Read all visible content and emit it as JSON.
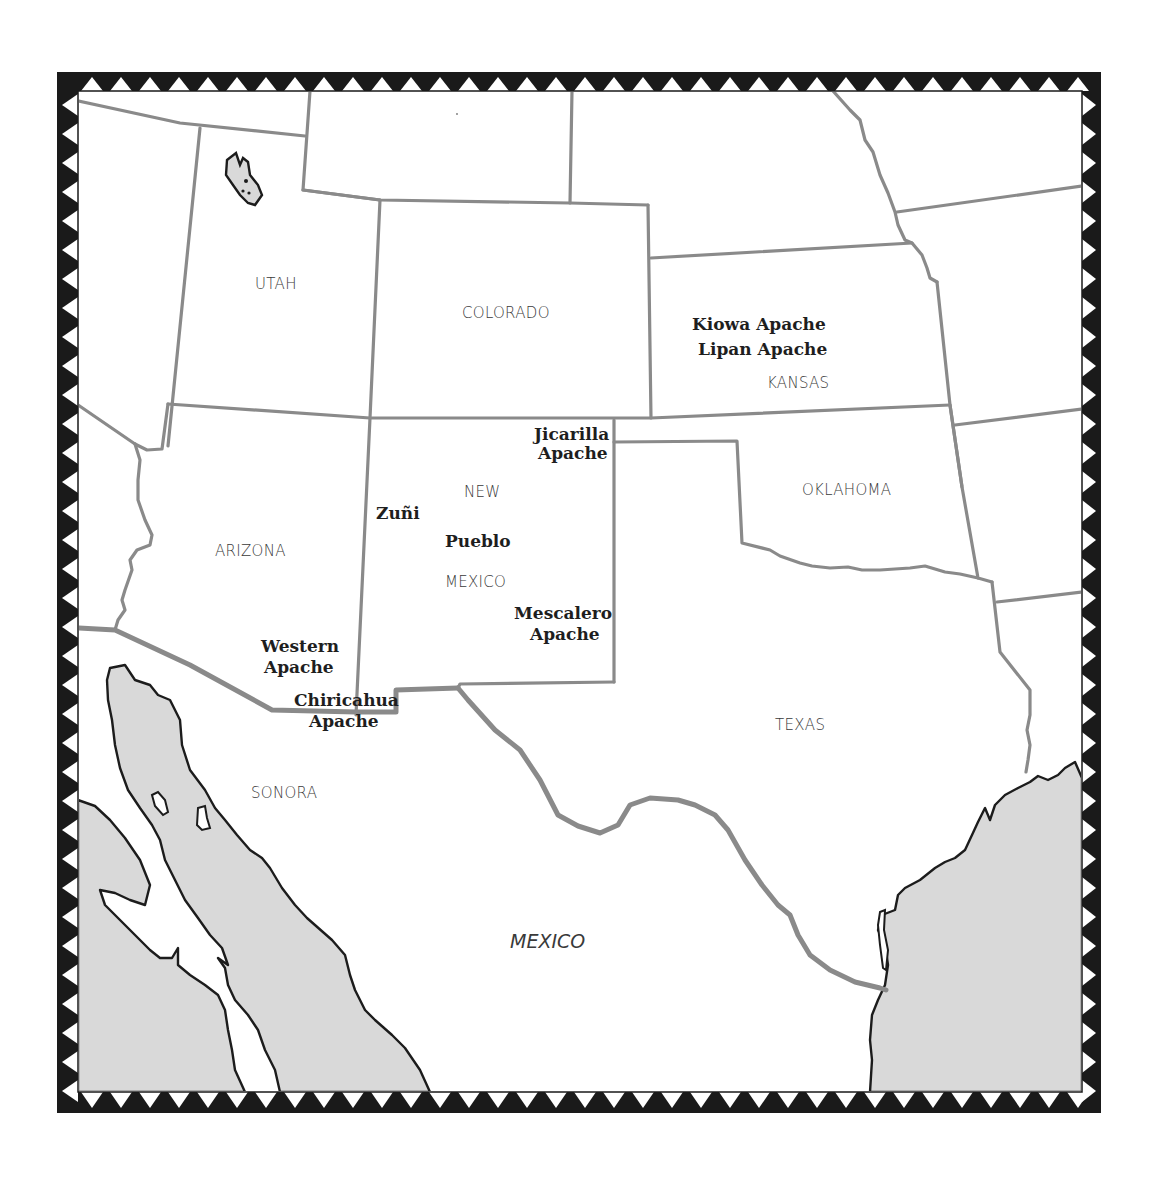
{
  "map": {
    "frame": {
      "outer": {
        "x": 57,
        "y": 72,
        "w": 1044,
        "h": 1041
      },
      "inner": {
        "x": 78,
        "y": 91,
        "w": 1004,
        "h": 1001
      },
      "band_color": "#1a1a1a",
      "triangle_color": "#ffffff"
    },
    "colors": {
      "land": "#ffffff",
      "water": "#d9d9d9",
      "state_border": "#8a8a8a",
      "coastline": "#1c1c1c",
      "label_text": "#3a3a3a",
      "tribe_text": "#1e1e1e"
    },
    "state_labels": [
      {
        "name": "utah",
        "text": "UTAH",
        "x": 255,
        "y": 289
      },
      {
        "name": "colorado",
        "text": "COLORADO",
        "x": 462,
        "y": 318
      },
      {
        "name": "kansas",
        "text": "KANSAS",
        "x": 767,
        "y": 388
      },
      {
        "name": "oklahoma",
        "text": "OKLAHOMA",
        "x": 802,
        "y": 495
      },
      {
        "name": "arizona",
        "text": "ARIZONA",
        "x": 215,
        "y": 556
      },
      {
        "name": "new-mexico-line1",
        "text": "NEW",
        "x": 464,
        "y": 497
      },
      {
        "name": "new-mexico-line2",
        "text": "MEXICO",
        "x": 445,
        "y": 587
      },
      {
        "name": "texas",
        "text": "TEXAS",
        "x": 775,
        "y": 730
      },
      {
        "name": "sonora",
        "text": "SONORA",
        "x": 251,
        "y": 798
      }
    ],
    "country_labels": [
      {
        "name": "mexico",
        "text": "MEXICO",
        "x": 510,
        "y": 948
      }
    ],
    "tribe_labels": [
      {
        "name": "kiowa-apache",
        "text": "Kiowa Apache",
        "x": 692,
        "y": 330
      },
      {
        "name": "lipan-apache",
        "text": "Lipan Apache",
        "x": 698,
        "y": 355
      },
      {
        "name": "jicarilla-apache-1",
        "text": "Jicarilla",
        "x": 534,
        "y": 440
      },
      {
        "name": "jicarilla-apache-2",
        "text": "Apache",
        "x": 538,
        "y": 459
      },
      {
        "name": "zuni",
        "text": "Zuñi",
        "x": 376,
        "y": 519
      },
      {
        "name": "pueblo",
        "text": "Pueblo",
        "x": 445,
        "y": 547
      },
      {
        "name": "mescalero-apache-1",
        "text": "Mescalero",
        "x": 514,
        "y": 619
      },
      {
        "name": "mescalero-apache-2",
        "text": "Apache",
        "x": 530,
        "y": 640
      },
      {
        "name": "western-apache-1",
        "text": "Western",
        "x": 261,
        "y": 652
      },
      {
        "name": "western-apache-2",
        "text": "Apache",
        "x": 264,
        "y": 673
      },
      {
        "name": "chiricahua-apache-1",
        "text": "Chiricahua",
        "x": 294,
        "y": 706
      },
      {
        "name": "chiricahua-apache-2",
        "text": "Apache",
        "x": 309,
        "y": 727
      }
    ]
  }
}
